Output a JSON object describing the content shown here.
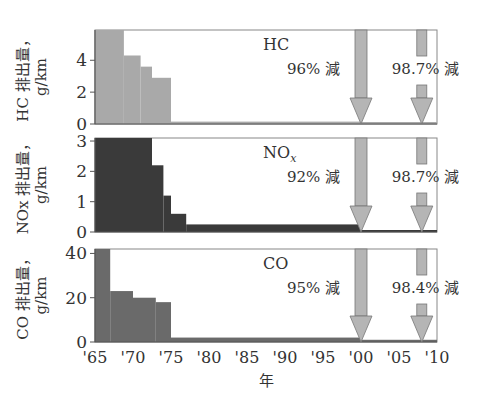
{
  "chart_data": [
    {
      "type": "area",
      "panel": "HC",
      "label": "HC",
      "ylabel": "HC 排出量，g/km",
      "yticks": [
        0,
        2,
        4
      ],
      "ylim": [
        0,
        5.9
      ],
      "fill": "#a9a9a9",
      "steps": [
        {
          "from": 1965,
          "to": 1968.8,
          "value": 5.9
        },
        {
          "from": 1968.8,
          "to": 1971,
          "value": 4.3
        },
        {
          "from": 1971,
          "to": 1972.5,
          "value": 3.6
        },
        {
          "from": 1972.5,
          "to": 1975,
          "value": 2.9
        },
        {
          "from": 1975,
          "to": 2000,
          "value": 0.15
        },
        {
          "from": 2000,
          "to": 2010,
          "value": 0.05
        }
      ],
      "annotations": [
        {
          "text": "96% 減",
          "arrow_year": 2000
        },
        {
          "text": "98.7% 減",
          "arrow_year": 2008
        }
      ]
    },
    {
      "type": "area",
      "panel": "NOx",
      "label": "NO",
      "label_sub": "x",
      "ylabel": "NOx 排出量，g/km",
      "yticks": [
        0,
        1,
        2,
        3
      ],
      "ylim": [
        0,
        3.1
      ],
      "fill": "#3a3a3a",
      "steps": [
        {
          "from": 1965,
          "to": 1972.5,
          "value": 3.1
        },
        {
          "from": 1972.5,
          "to": 1974,
          "value": 2.2
        },
        {
          "from": 1974,
          "to": 1975,
          "value": 1.2
        },
        {
          "from": 1975,
          "to": 1977,
          "value": 0.6
        },
        {
          "from": 1977,
          "to": 2000,
          "value": 0.25
        },
        {
          "from": 2000,
          "to": 2010,
          "value": 0.05
        }
      ],
      "annotations": [
        {
          "text": "92% 減",
          "arrow_year": 2000
        },
        {
          "text": "98.7% 減",
          "arrow_year": 2008
        }
      ]
    },
    {
      "type": "area",
      "panel": "CO",
      "label": "CO",
      "ylabel": "CO 排出量，g/km",
      "yticks": [
        0,
        20,
        40
      ],
      "ylim": [
        0,
        42
      ],
      "fill": "#6a6a6a",
      "steps": [
        {
          "from": 1965,
          "to": 1967,
          "value": 42
        },
        {
          "from": 1967,
          "to": 1970,
          "value": 23
        },
        {
          "from": 1970,
          "to": 1973,
          "value": 20
        },
        {
          "from": 1973,
          "to": 1975,
          "value": 18
        },
        {
          "from": 1975,
          "to": 2000,
          "value": 2
        },
        {
          "from": 2000,
          "to": 2010,
          "value": 1
        }
      ],
      "annotations": [
        {
          "text": "95% 減",
          "arrow_year": 2000
        },
        {
          "text": "98.4% 減",
          "arrow_year": 2008
        }
      ]
    }
  ],
  "xaxis": {
    "label": "年",
    "ticks": [
      "'65",
      "'70",
      "'75",
      "'80",
      "'85",
      "'90",
      "'95",
      "'00",
      "'05",
      "'10"
    ],
    "range": [
      1965,
      2010
    ]
  },
  "colors": {
    "arrow_fill": "#b5b5b5",
    "arrow_stroke": "#777777",
    "axis": "#555555"
  }
}
